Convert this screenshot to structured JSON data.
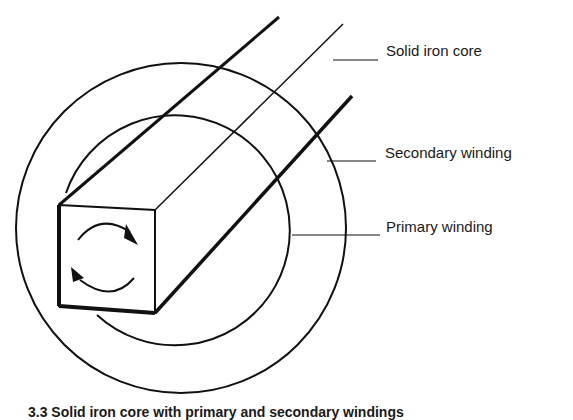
{
  "figure": {
    "labels": {
      "core": "Solid iron core",
      "secondary": "Secondary winding",
      "primary": "Primary winding"
    },
    "caption": "3.3  Solid iron core with primary and secondary windings"
  },
  "colors": {
    "line": "#111111",
    "background": "#ffffff"
  }
}
